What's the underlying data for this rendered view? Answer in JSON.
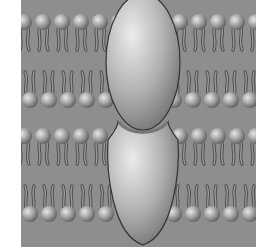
{
  "figure": {
    "colors": {
      "background": "#ffffff",
      "panel": "#8e8e8e",
      "lipid_head": "#a8a8a8",
      "lipid_tail": "#6a6a6a",
      "protein": "#b4b4b4",
      "outline": "#333333"
    },
    "membranes": [
      {
        "name": "upper-membrane",
        "head_rows_y": [
          22,
          100
        ]
      },
      {
        "name": "lower-membrane",
        "head_rows_y": [
          136,
          214
        ]
      }
    ],
    "proteins": [
      {
        "name": "upper-connexon",
        "cx": 143,
        "cy": 62,
        "rx": 37,
        "ry": 68
      },
      {
        "name": "lower-connexon",
        "cx": 143,
        "cy": 185,
        "rx": 37,
        "ry": 60
      }
    ]
  }
}
